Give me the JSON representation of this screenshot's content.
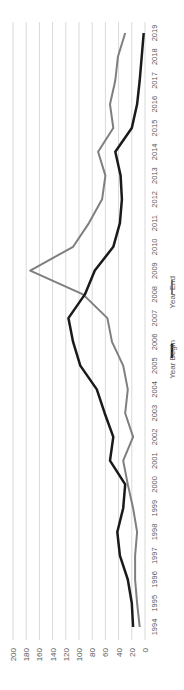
{
  "chart_data": {
    "type": "line",
    "title": "",
    "orientation": "rotated-90-ccw",
    "xlabel": "",
    "ylabel": "",
    "ylim": [
      0,
      200
    ],
    "yticks": [
      0,
      20,
      40,
      60,
      80,
      100,
      120,
      140,
      160,
      180,
      200
    ],
    "grid": true,
    "legend_position": "bottom",
    "categories": [
      "1994",
      "1995",
      "1996",
      "1997",
      "1998",
      "1999",
      "2000",
      "2001",
      "2002",
      "2003",
      "2004",
      "2005",
      "2006",
      "2007",
      "2008",
      "2009",
      "2010",
      "2011",
      "2012",
      "2013",
      "2014",
      "2015",
      "2016",
      "2017",
      "2018",
      "2019"
    ],
    "series": [
      {
        "name": "Year Begin",
        "color": "#1a1a1a",
        "values": [
          18,
          20,
          26,
          38,
          42,
          33,
          30,
          53,
          48,
          61,
          73,
          98,
          109,
          116,
          91,
          76,
          48,
          38,
          35,
          37,
          45,
          20,
          12,
          8,
          5,
          2
        ]
      },
      {
        "name": "Year End",
        "color": "#7f7f7f",
        "values": [
          8,
          12,
          15,
          15,
          12,
          18,
          26,
          33,
          18,
          30,
          26,
          33,
          50,
          57,
          94,
          174,
          109,
          85,
          65,
          60,
          71,
          48,
          53,
          45,
          41,
          30
        ]
      }
    ]
  },
  "legend": {
    "items": [
      {
        "label": "Year Begin",
        "color": "#1a1a1a"
      },
      {
        "label": "Year End",
        "color": "#7f7f7f"
      }
    ]
  }
}
